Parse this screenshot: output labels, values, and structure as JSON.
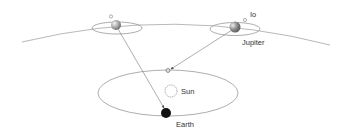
{
  "diagram": {
    "labels": {
      "io": "Io",
      "jupiter": "Jupiter",
      "sun": "Sun",
      "earth": "Earth"
    },
    "colors": {
      "orbit_line": "#8a8a8a",
      "jupiter_fill": "#9a9a9a",
      "earth_fill": "#111111",
      "sun_stroke": "#8a8a8a",
      "arrow": "#777777",
      "text": "#333333"
    },
    "bodies": [
      "Jupiter (left position)",
      "Jupiter (right position)",
      "Io",
      "Sun",
      "Earth (near)",
      "Earth (far)"
    ]
  }
}
